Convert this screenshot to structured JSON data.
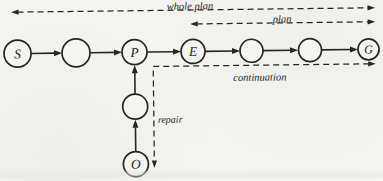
{
  "colors": {
    "paper": "#f5f4f0",
    "ink": "#262626"
  },
  "nodes": {
    "s": {
      "label": "S"
    },
    "p": {
      "label": "P"
    },
    "e": {
      "label": "E"
    },
    "g": {
      "label": "G"
    },
    "o": {
      "label": "O"
    }
  },
  "spans": {
    "whole_plan": {
      "label": "whole plan",
      "style": "dashed",
      "arrows": "both"
    },
    "plan": {
      "label": "plan",
      "style": "dashed",
      "arrows": "both"
    },
    "continuation": {
      "label": "continuation",
      "style": "dashed",
      "arrows": "right"
    },
    "repair": {
      "label": "repair",
      "style": "dashed",
      "arrows": "down"
    }
  },
  "structure": {
    "main_chain": [
      "S",
      "",
      "P",
      "E",
      "",
      "",
      "G"
    ],
    "repair_branch": [
      "O",
      "",
      "P"
    ],
    "edges": [
      {
        "from": "S",
        "to": "blank1",
        "style": "solid-arrow"
      },
      {
        "from": "blank1",
        "to": "P",
        "style": "solid-arrow"
      },
      {
        "from": "P",
        "to": "E",
        "style": "solid-arrow"
      },
      {
        "from": "E",
        "to": "blank2",
        "style": "solid-arrow"
      },
      {
        "from": "blank2",
        "to": "blank3",
        "style": "solid-arrow"
      },
      {
        "from": "blank3",
        "to": "G",
        "style": "solid-arrow"
      },
      {
        "from": "O",
        "to": "blank4",
        "style": "solid-arrow"
      },
      {
        "from": "blank4",
        "to": "P",
        "style": "solid-arrow"
      }
    ]
  }
}
